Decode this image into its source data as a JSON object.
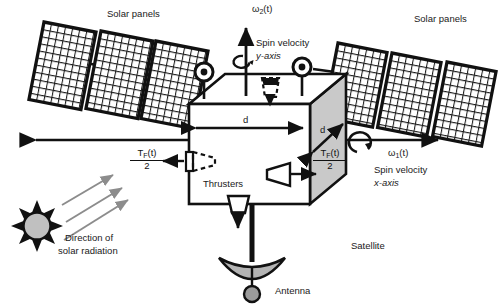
{
  "figure": {
    "type": "engineering-diagram",
    "background_color": "#ffffff",
    "line_color": "#111111",
    "panel_fill": "#ffffff",
    "body_shade_color": "#c9c9c9",
    "antenna_color": "#b4b4b4",
    "sun_color": "#c0c0c0",
    "ray_color": "#8c8c8c"
  },
  "labels": {
    "solar_panels_left": "Solar panels",
    "solar_panels_right": "Solar panels",
    "omega2_symbol": "ω",
    "omega2_sub": "2",
    "omega2_arg": "(t)",
    "spin_velocity_y_line1": "Spin velocity",
    "spin_velocity_y_line2": "y-axis",
    "omega1_symbol": "ω",
    "omega1_sub": "1",
    "omega1_arg": "(t)",
    "spin_velocity_x_line1": "Spin velocity",
    "spin_velocity_x_line2": "x-axis",
    "thrusters": "Thrusters",
    "satellite": "Satellite",
    "antenna": "Antenna",
    "solar_radiation_line1": "Direction of",
    "solar_radiation_line2": "solar radiation",
    "dim_front": "d",
    "dim_depth": "d",
    "force_left_num": "T",
    "force_left_sub": "F",
    "force_left_arg": "(t)",
    "force_left_den": "2",
    "force_right_num": "T",
    "force_right_sub": "F",
    "force_right_arg": "(t)",
    "force_right_den": "2"
  },
  "geometry": {
    "body_front": {
      "x": 189,
      "y": 104,
      "w": 121,
      "h": 100
    },
    "body_depth_offset": {
      "dx": 36,
      "dy": -30
    },
    "panels_left_count": 3,
    "panels_right_count": 3,
    "panel_grid_cols": 12,
    "panel_grid_rows": 16,
    "sun_rays": 8,
    "radiation_arrows": 3
  }
}
